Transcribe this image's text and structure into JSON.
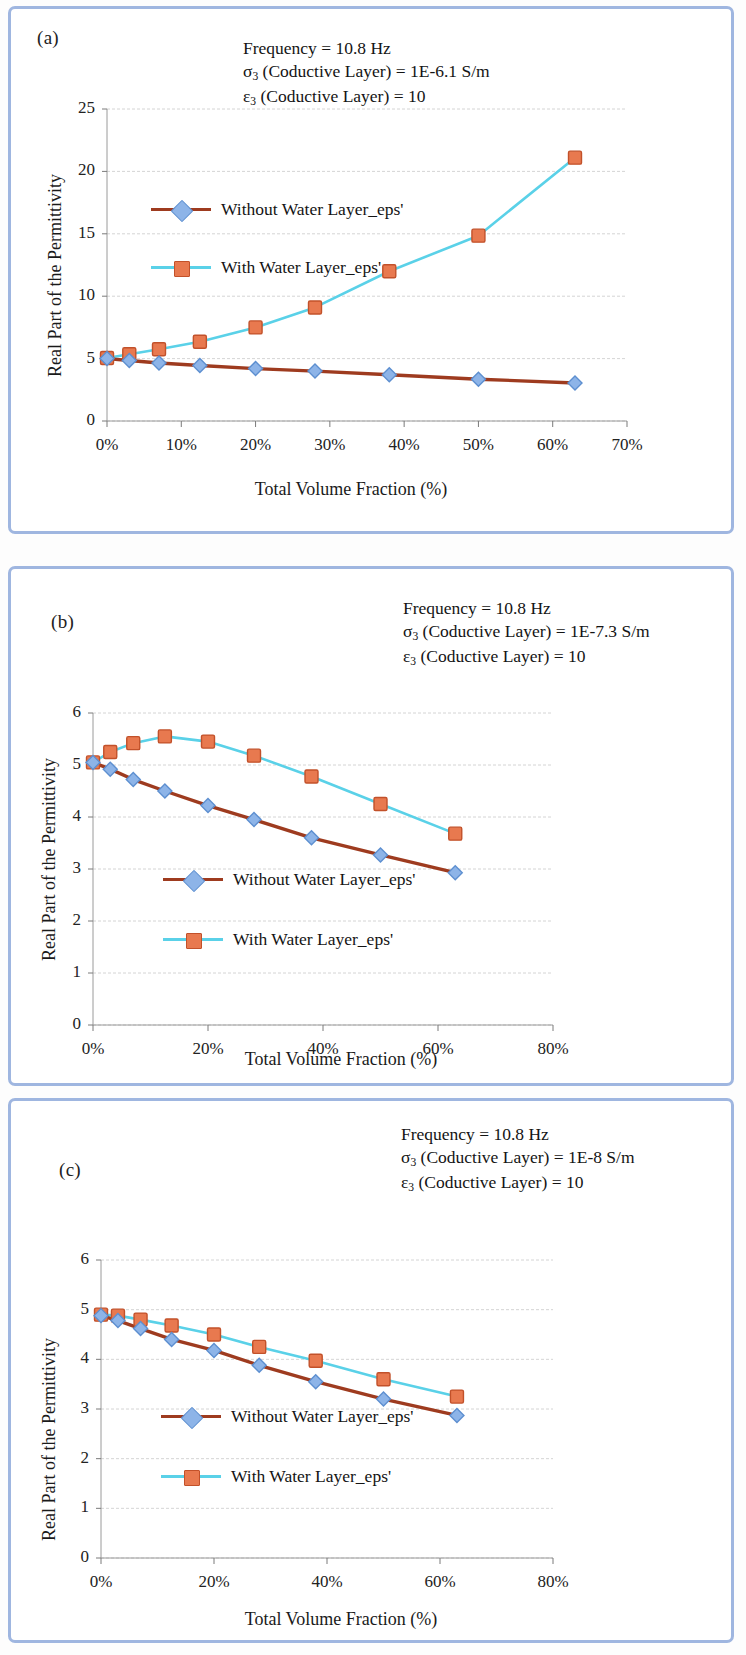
{
  "page": {
    "frame_color": "#9fb6e0",
    "background": "#fdfdfd"
  },
  "series_style": {
    "without_water": {
      "line_color": "#9e3b1f",
      "marker_fill": "#8db4e8",
      "marker_edge": "#5d8fd0",
      "marker_shape": "diamond"
    },
    "with_water": {
      "line_color": "#5ad1e8",
      "marker_fill": "#e8794f",
      "marker_edge": "#c2512a",
      "marker_shape": "square"
    }
  },
  "panels": [
    {
      "id": "a",
      "label": "(a)",
      "annotation": {
        "line1": "Frequency = 10.8 Hz",
        "line2_sym": "σ",
        "line2_sub": "3",
        "line2_rest": " (Coductive Layer) = 1E-6.1 S/m",
        "line3_sym": "ε",
        "line3_sub": "3",
        "line3_rest": " (Coductive Layer) = 10"
      },
      "legend": [
        {
          "label": "Without Water Layer_eps'",
          "series": "without_water"
        },
        {
          "label": "With Water Layer_eps'",
          "series": "with_water"
        }
      ],
      "chart_data": {
        "type": "line",
        "title": "",
        "xlabel": "Total Volume Fraction (%)",
        "ylabel": "Real Part of the Permittivity",
        "xlim": [
          0,
          70
        ],
        "ylim": [
          0,
          25
        ],
        "xticks": [
          0,
          10,
          20,
          30,
          40,
          50,
          60,
          70
        ],
        "xticklabels": [
          "0%",
          "10%",
          "20%",
          "30%",
          "40%",
          "50%",
          "60%",
          "70%"
        ],
        "yticks": [
          0,
          5,
          10,
          15,
          20,
          25
        ],
        "yticklabels": [
          "0",
          "5",
          "10",
          "15",
          "20",
          "25"
        ],
        "grid": "horizontal",
        "legend_position": "inside-upper-left",
        "x": [
          0,
          3,
          7,
          12.5,
          20,
          28,
          38,
          50,
          63
        ],
        "series": [
          {
            "name": "Without Water Layer_eps'",
            "values": [
              5.0,
              4.85,
              4.65,
              4.45,
              4.2,
              4.0,
              3.7,
              3.35,
              3.05
            ]
          },
          {
            "name": "With Water Layer_eps'",
            "values": [
              5.05,
              5.35,
              5.75,
              6.35,
              7.5,
              9.1,
              12.0,
              14.85,
              21.1
            ]
          }
        ]
      }
    },
    {
      "id": "b",
      "label": "(b)",
      "annotation": {
        "line1": "Frequency = 10.8 Hz",
        "line2_sym": "σ",
        "line2_sub": "3",
        "line2_rest": " (Coductive Layer) = 1E-7.3 S/m",
        "line3_sym": "ε",
        "line3_sub": "3",
        "line3_rest": " (Coductive Layer) = 10"
      },
      "legend": [
        {
          "label": "Without Water Layer_eps'",
          "series": "without_water"
        },
        {
          "label": "With Water Layer_eps'",
          "series": "with_water"
        }
      ],
      "chart_data": {
        "type": "line",
        "title": "",
        "xlabel": "Total Volume Fraction (%)",
        "ylabel": "Real Part of the Permittivity",
        "xlim": [
          0,
          80
        ],
        "ylim": [
          0,
          6
        ],
        "xticks": [
          0,
          20,
          40,
          60,
          80
        ],
        "xticklabels": [
          "0%",
          "20%",
          "40%",
          "60%",
          "80%"
        ],
        "yticks": [
          0,
          1,
          2,
          3,
          4,
          5,
          6
        ],
        "yticklabels": [
          "0",
          "1",
          "2",
          "3",
          "4",
          "5",
          "6"
        ],
        "grid": "horizontal",
        "legend_position": "inside-lower-center",
        "x": [
          0,
          3,
          7,
          12.5,
          20,
          28,
          38,
          50,
          63
        ],
        "series": [
          {
            "name": "Without Water Layer_eps'",
            "values": [
              5.05,
              4.92,
              4.72,
              4.5,
              4.22,
              3.95,
              3.6,
              3.27,
              2.93
            ]
          },
          {
            "name": "With Water Layer_eps'",
            "values": [
              5.05,
              5.25,
              5.42,
              5.55,
              5.45,
              5.18,
              4.78,
              4.25,
              3.68
            ]
          }
        ]
      }
    },
    {
      "id": "c",
      "label": "(c)",
      "annotation": {
        "line1": "Frequency = 10.8 Hz",
        "line2_sym": "σ",
        "line2_sub": "3",
        "line2_rest": " (Coductive Layer) = 1E-8 S/m",
        "line3_sym": "ε",
        "line3_sub": "3",
        "line3_rest": " (Coductive Layer) = 10"
      },
      "legend": [
        {
          "label": "Without Water Layer_eps'",
          "series": "without_water"
        },
        {
          "label": "With Water Layer_eps'",
          "series": "with_water"
        }
      ],
      "chart_data": {
        "type": "line",
        "title": "",
        "xlabel": "Total Volume Fraction (%)",
        "ylabel": "Real Part of the Permittivity",
        "xlim": [
          0,
          80
        ],
        "ylim": [
          0,
          6
        ],
        "xticks": [
          0,
          20,
          40,
          60,
          80
        ],
        "xticklabels": [
          "0%",
          "20%",
          "40%",
          "60%",
          "80%"
        ],
        "yticks": [
          0,
          1,
          2,
          3,
          4,
          5,
          6
        ],
        "yticklabels": [
          "0",
          "1",
          "2",
          "3",
          "4",
          "5",
          "6"
        ],
        "grid": "horizontal",
        "legend_position": "inside-lower-center",
        "x": [
          0,
          3,
          7,
          12.5,
          20,
          28,
          38,
          50,
          63
        ],
        "series": [
          {
            "name": "Without Water Layer_eps'",
            "values": [
              4.88,
              4.78,
              4.62,
              4.4,
              4.18,
              3.88,
              3.55,
              3.2,
              2.87
            ]
          },
          {
            "name": "With Water Layer_eps'",
            "values": [
              4.9,
              4.88,
              4.8,
              4.68,
              4.5,
              4.25,
              3.97,
              3.6,
              3.25
            ]
          }
        ]
      }
    }
  ]
}
